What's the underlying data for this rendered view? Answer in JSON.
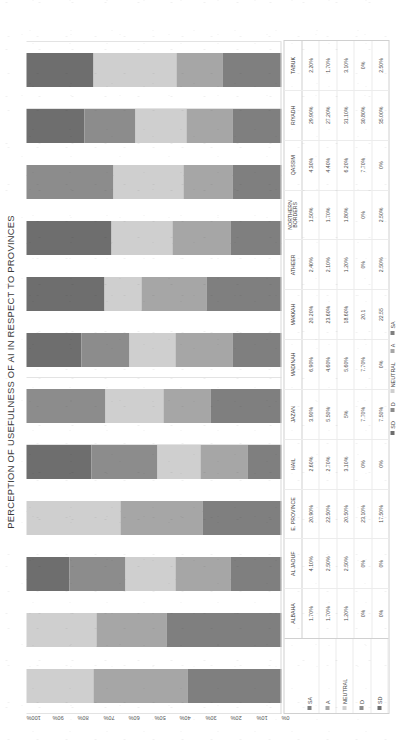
{
  "chart_data": {
    "type": "bar",
    "stacked": true,
    "orientation": "horizontal-rotated",
    "title": "PERCEPTION OF USEFULNESS OF AI IN RESPECT TO PROVINCES",
    "xlabel": "",
    "ylabel": "",
    "ylim": [
      0,
      100
    ],
    "grid": true,
    "legend_position": "bottom",
    "axis_ticks": [
      "100%",
      "90%",
      "80%",
      "70%",
      "60%",
      "50%",
      "40%",
      "30%",
      "20%",
      "10%",
      "0%"
    ],
    "categories": [
      "ALBAHA",
      "AL JAOUF",
      "E. PROVINCE",
      "HAIL",
      "JAZAN",
      "MADINAH",
      "MAKKAH",
      "ATHEER",
      "NORTHERN BORDERS",
      "QASSIM",
      "RIYADH",
      "TABUK"
    ],
    "series": [
      {
        "name": "SA",
        "color": "#7f7f7f",
        "values": [
          1.7,
          4.1,
          20.9,
          2.6,
          3.9,
          6.9,
          20.2,
          2.4,
          1.5,
          4.3,
          29.9,
          2.2
        ],
        "labels": [
          "1.70%",
          "4.10%",
          "20.90%",
          "2.60%",
          "3.90%",
          "6.90%",
          "20.20%",
          "2.40%",
          "1.50%",
          "4.30%",
          "29.90%",
          "2.20%"
        ]
      },
      {
        "name": "A",
        "color": "#a6a6a6",
        "values": [
          1.7,
          2.5,
          22.5,
          2.7,
          5.5,
          4.6,
          23.6,
          2.1,
          1.7,
          4.4,
          27.2,
          1.7
        ],
        "labels": [
          "1.70%",
          "2.50%",
          "22.50%",
          "2.70%",
          "5.50%",
          "4.60%",
          "23.60%",
          "2.10%",
          "1.70%",
          "4.40%",
          "27.20%",
          "1.70%"
        ]
      },
      {
        "name": "NEUTRAL",
        "color": "#cfcfcf",
        "values": [
          1.2,
          2.5,
          20.5,
          3.1,
          5.0,
          5.6,
          18.6,
          1.2,
          1.8,
          6.2,
          31.1,
          3.1
        ],
        "labels": [
          "1.20%",
          "2.50%",
          "20.50%",
          "3.10%",
          "5%",
          "5.60%",
          "18.60%",
          "1.20%",
          "1.80%",
          "6.20%",
          "31.10%",
          "3.10%"
        ]
      },
      {
        "name": "D",
        "color": "#8c8c8c",
        "values": [
          0,
          0,
          23.1,
          0,
          7.7,
          7.7,
          20.1,
          0,
          0,
          7.7,
          30.8,
          0
        ],
        "labels": [
          "0%",
          "0%",
          "23.10%",
          "0%",
          "7.70%",
          "7.70%",
          "20.1",
          "0%",
          "0%",
          "7.70%",
          "30.80%",
          "0%"
        ]
      },
      {
        "name": "SD",
        "color": "#6e6e6e",
        "values": [
          0,
          0,
          17.5,
          0,
          7.5,
          0,
          22.5,
          2.5,
          2.5,
          0,
          35.0,
          2.5
        ],
        "labels": [
          "0%",
          "0%",
          "17.50%",
          "0%",
          "7.50%",
          "0%",
          "22.55",
          "2.50%",
          "2.50%",
          "0%",
          "35.00%",
          "2.50%"
        ]
      }
    ]
  },
  "table": {
    "row_headers": [
      "SA",
      "A",
      "NEUTRAL",
      "D",
      "SD"
    ]
  },
  "legend": {
    "items": [
      "SD",
      "D",
      "NEUTRAL",
      "A",
      "SA"
    ]
  }
}
